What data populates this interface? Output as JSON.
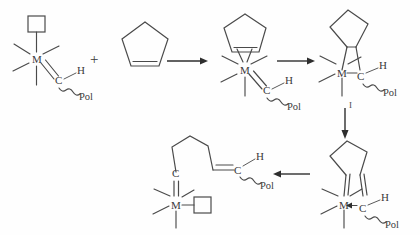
{
  "figure": {
    "background_color": "#fefefe",
    "line_color": "#4a4a4a",
    "arrow_color": "#2e2e2e",
    "width": 420,
    "height": 235
  },
  "labels": {
    "metal": "M",
    "carbon": "C",
    "hydrogen": "H",
    "polymer": "Pol",
    "plus": "+",
    "intermediate_number": "I"
  },
  "structures": [
    {
      "id": "alkylidene-complex",
      "name": "metal alkylidene with vacant site",
      "atoms": [
        "M",
        "C",
        "H"
      ],
      "polymer_chain": "Pol",
      "vacant_site": "square",
      "position": "top-left"
    },
    {
      "id": "cyclopentene",
      "name": "cyclopentene monomer",
      "ring_size": 5,
      "double_bonds": 1,
      "position": "top-center-left"
    },
    {
      "id": "pi-complex",
      "name": "cyclopentene pi-coordinated alkylidene complex",
      "atoms": [
        "M",
        "C",
        "H"
      ],
      "polymer_chain": "Pol",
      "ring_size": 5,
      "position": "top-center-right"
    },
    {
      "id": "metallacyclobutane",
      "name": "bicyclic metallacyclobutane intermediate",
      "atoms": [
        "M",
        "C",
        "H"
      ],
      "polymer_chain": "Pol",
      "ring_size": 5,
      "label": "I",
      "position": "top-right"
    },
    {
      "id": "bis-carbene",
      "name": "ring-opened biscarbene with dative bond to metal",
      "atoms": [
        "M",
        "C",
        "H"
      ],
      "polymer_chain": "Pol",
      "ring_size": 5,
      "position": "bottom-right"
    },
    {
      "id": "extended-alkylidene",
      "name": "chain-extended metal alkylidene with vacant site",
      "atoms": [
        "M",
        "C",
        "C",
        "H"
      ],
      "polymer_chain": "Pol",
      "vacant_site": "square",
      "position": "bottom-left"
    }
  ],
  "arrows": [
    {
      "id": "arrow-1",
      "direction": "right",
      "from": "cyclopentene",
      "to": "pi-complex"
    },
    {
      "id": "arrow-2",
      "direction": "right",
      "from": "pi-complex",
      "to": "metallacyclobutane"
    },
    {
      "id": "arrow-3",
      "direction": "down",
      "from": "metallacyclobutane",
      "to": "bis-carbene"
    },
    {
      "id": "arrow-4",
      "direction": "left",
      "from": "bis-carbene",
      "to": "extended-alkylidene"
    }
  ]
}
